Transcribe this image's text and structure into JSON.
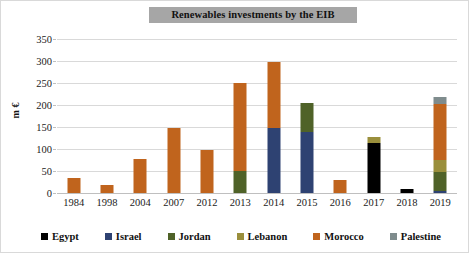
{
  "chart_data": {
    "type": "bar",
    "subtype": "stacked-column",
    "title": "Renewables investments by the EIB",
    "xlabel": "",
    "ylabel": "m €",
    "ylim": [
      0,
      350
    ],
    "ytick_step": 50,
    "yticks": [
      0,
      50,
      100,
      150,
      200,
      250,
      300,
      350
    ],
    "ytick_labels": [
      "0",
      "50",
      "100",
      "150",
      "200",
      "250",
      "300",
      "350"
    ],
    "grid": true,
    "grid_axis": "y",
    "legend_position": "bottom",
    "categories": [
      "1984",
      "1998",
      "2004",
      "2007",
      "2012",
      "2013",
      "2014",
      "2015",
      "2016",
      "2017",
      "2018",
      "2019"
    ],
    "series": [
      {
        "name": "Egypt",
        "color": "#000000",
        "values": [
          0,
          0,
          0,
          0,
          0,
          0,
          0,
          0,
          0,
          113,
          9,
          0
        ]
      },
      {
        "name": "Israel",
        "color": "#2e4272",
        "values": [
          0,
          0,
          0,
          0,
          0,
          0,
          148,
          138,
          0,
          0,
          0,
          5
        ]
      },
      {
        "name": "Jordan",
        "color": "#4f6228",
        "values": [
          0,
          0,
          0,
          0,
          0,
          50,
          0,
          67,
          0,
          0,
          0,
          42
        ]
      },
      {
        "name": "Lebanon",
        "color": "#9a8f3c",
        "values": [
          0,
          0,
          0,
          0,
          0,
          0,
          0,
          0,
          0,
          14,
          0,
          29
        ]
      },
      {
        "name": "Morocco",
        "color": "#c0641d",
        "values": [
          33,
          19,
          78,
          148,
          98,
          200,
          150,
          0,
          30,
          0,
          0,
          127
        ]
      },
      {
        "name": "Palestine",
        "color": "#7f8c8d",
        "values": [
          0,
          0,
          0,
          0,
          0,
          0,
          0,
          0,
          0,
          0,
          0,
          15
        ]
      }
    ],
    "totals": [
      33,
      19,
      78,
      148,
      98,
      250,
      298,
      205,
      30,
      127,
      9,
      218
    ]
  },
  "legend": {
    "items": [
      {
        "label": "Egypt",
        "color": "#000000"
      },
      {
        "label": "Israel",
        "color": "#2e4272"
      },
      {
        "label": "Jordan",
        "color": "#4f6228"
      },
      {
        "label": "Lebanon",
        "color": "#9a8f3c"
      },
      {
        "label": "Morocco",
        "color": "#c0641d"
      },
      {
        "label": "Palestine",
        "color": "#7f8c8d"
      }
    ]
  },
  "colors": {
    "title_banner_background": "#a6a6a6",
    "gridline": "#d9d9d9",
    "plot_background": "#ffffff",
    "text": "#222222"
  }
}
